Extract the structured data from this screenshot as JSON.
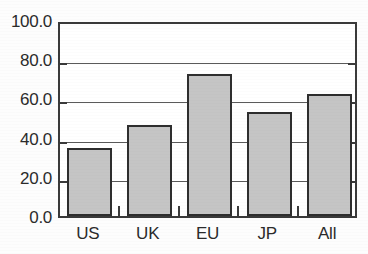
{
  "chart_data": {
    "type": "bar",
    "title": "",
    "subtitle": "",
    "xlabel": "",
    "ylabel": "",
    "categories": [
      "US",
      "UK",
      "EU",
      "JP",
      "All"
    ],
    "values": [
      34.5,
      46.5,
      72.5,
      53.0,
      62.0
    ],
    "ylim": [
      0.0,
      100.0
    ],
    "ytick_step": 20.0,
    "ytick_labels": [
      "0.0",
      "20.0",
      "40.0",
      "60.0",
      "80.0",
      "100.0"
    ],
    "ytick_values": [
      0.0,
      20.0,
      40.0,
      60.0,
      80.0,
      100.0
    ],
    "grid": "horizontal",
    "legend": "none",
    "annotations": [],
    "bar_fill_color": "#c5c5c5",
    "bar_border_color": "#2e2e2e",
    "axis_color": "#3a3a3a",
    "gridline_color": "#5a5a5a",
    "text_color": "#2b2b2b",
    "plot_background": "#ffffff"
  }
}
